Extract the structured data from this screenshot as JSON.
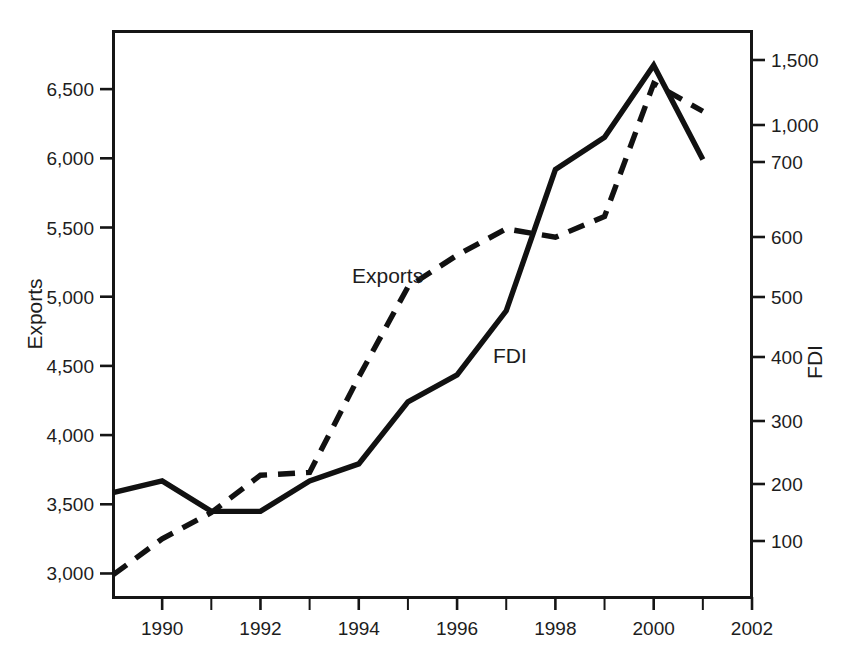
{
  "chart_data": {
    "type": "line",
    "title": "",
    "subtitle": "",
    "xlabel": "",
    "ylabel": "Exports",
    "y2label": "FDI",
    "grid": false,
    "legend_position": "inline-annotations",
    "x": [
      1989,
      1990,
      1991,
      1992,
      1993,
      1994,
      1995,
      1996,
      1997,
      1998,
      1999,
      2000,
      2001
    ],
    "xlim": [
      1989,
      2002
    ],
    "x_tick_labels": [
      "1990",
      "1992",
      "1994",
      "1996",
      "1998",
      "2000",
      "2002"
    ],
    "x_tick_values": [
      1990,
      1992,
      1994,
      1996,
      1998,
      2000,
      2002
    ],
    "x_minor_tick_values": [
      1991,
      1993,
      1995,
      1997,
      1999,
      2001
    ],
    "ylim": [
      2830,
      6920
    ],
    "y_tick_labels": [
      "3,000",
      "3,500",
      "4,000",
      "4,500",
      "5,000",
      "5,500",
      "6,000",
      "6,500"
    ],
    "y_tick_values": [
      3000,
      3500,
      4000,
      4500,
      5000,
      5500,
      6000,
      6500
    ],
    "y2_tick_labels": [
      "100",
      "200",
      "300",
      "400",
      "500",
      "600",
      "700",
      "1,000",
      "1,500"
    ],
    "y2_tick_values": [
      100,
      200,
      300,
      400,
      500,
      600,
      700,
      1000,
      1500
    ],
    "y2_tick_pixels": [
      541,
      484,
      421,
      357,
      297,
      237,
      162,
      125,
      60
    ],
    "y2_note": "right axis is non-linear; 700-1,000-1,500 are compressed",
    "series": [
      {
        "name": "Exports",
        "axis": "left",
        "style": "dashed",
        "color": "#111111",
        "annotation": "Exports",
        "values": [
          2990,
          3250,
          3440,
          3710,
          3730,
          4420,
          5070,
          5300,
          5490,
          5430,
          5580,
          6540,
          6340
        ]
      },
      {
        "name": "FDI",
        "axis": "right",
        "style": "solid",
        "color": "#111111",
        "annotation": "FDI",
        "values": [
          185,
          205,
          152,
          152,
          205,
          232,
          330,
          372,
          477,
          690,
          900,
          1460,
          720
        ]
      }
    ]
  },
  "annotations": {
    "exports_label": "Exports",
    "fdi_label": "FDI"
  },
  "axes": {
    "left_title": "Exports",
    "right_title": "FDI"
  }
}
